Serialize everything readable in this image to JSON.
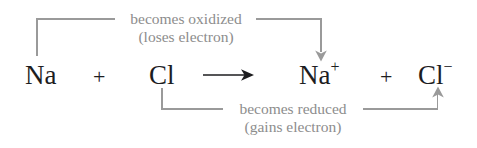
{
  "diagram": {
    "background_color": "#ffffff",
    "equation_color": "#1d1d1f",
    "annotation_color": "#8d8d8d",
    "bracket_color": "#9a9a9a"
  },
  "equation": {
    "reactant_1": "Na",
    "plus_1": "+",
    "reactant_2": "Cl",
    "arrow": "⟶",
    "product_1_symbol": "Na",
    "product_1_charge": "+",
    "plus_2": "+",
    "product_2_symbol": "Cl",
    "product_2_charge": "−",
    "full_text": "Na + Cl ⟶ Na+ + Cl−"
  },
  "annotations": {
    "oxidation": {
      "line_1": "becomes oxidized",
      "line_2": "(loses electron)",
      "from": "Na",
      "to": "Na+",
      "direction": "down-arrow"
    },
    "reduction": {
      "line_1": "becomes reduced",
      "line_2": "(gains electron)",
      "from": "Cl",
      "to": "Cl−",
      "direction": "up-arrow"
    }
  }
}
